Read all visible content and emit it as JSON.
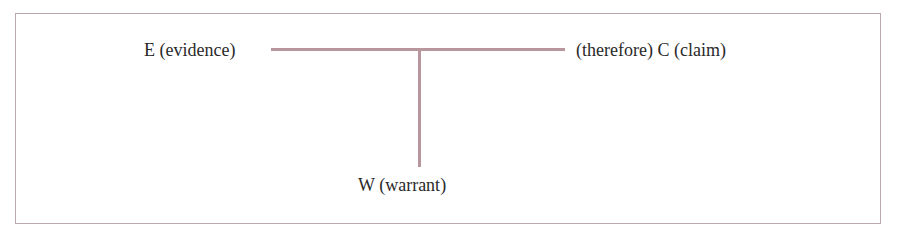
{
  "diagram": {
    "type": "Toulmin argument structure",
    "nodes": {
      "evidence": "E (evidence)",
      "claim": "(therefore) C (claim)",
      "warrant": "W (warrant)"
    },
    "edges": [
      {
        "from": "evidence",
        "to": "claim",
        "style": "horizontal line"
      },
      {
        "from": "evidence-claim line",
        "to": "warrant",
        "style": "vertical line"
      }
    ],
    "colors": {
      "line": "#b8969e",
      "frame": "#b9a9ad",
      "text": "#2a2a2a"
    }
  }
}
